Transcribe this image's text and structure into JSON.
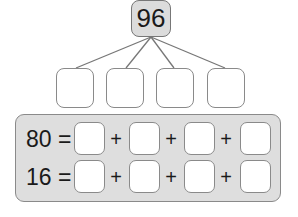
{
  "diagram": {
    "root": {
      "value": "96"
    },
    "children": [
      "",
      "",
      "",
      ""
    ],
    "equations": [
      {
        "total": "80",
        "equals": "=",
        "terms": [
          "",
          "",
          "",
          ""
        ],
        "operator": "+"
      },
      {
        "total": "16",
        "equals": "=",
        "terms": [
          "",
          "",
          "",
          ""
        ],
        "operator": "+"
      }
    ],
    "colors": {
      "root_fill": "#dcdcdc",
      "panel_fill": "#dedede",
      "border": "#8a8a8a"
    }
  }
}
